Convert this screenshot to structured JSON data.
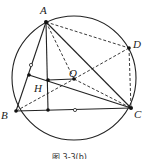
{
  "figure": {
    "caption": "图 3-3(b)",
    "circle": {
      "cx": 74,
      "cy": 78,
      "r": 62
    },
    "points": {
      "A": {
        "x": 46,
        "y": 22,
        "label": "A",
        "lx": 40,
        "ly": 14
      },
      "B": {
        "x": 16,
        "y": 111,
        "label": "B",
        "lx": 2,
        "ly": 118
      },
      "C": {
        "x": 131,
        "y": 108,
        "label": "C",
        "lx": 134,
        "ly": 117
      },
      "D": {
        "x": 129,
        "y": 48,
        "label": "D",
        "lx": 133,
        "ly": 46
      },
      "O": {
        "x": 74,
        "y": 79,
        "label": "O",
        "lx": 69,
        "ly": 75
      },
      "H": {
        "x": 48,
        "y": 80,
        "label": "H",
        "lx": 34,
        "ly": 91
      }
    },
    "labels": {
      "A": "A",
      "B": "B",
      "C": "C",
      "D": "D",
      "O": "O",
      "H": "H"
    }
  }
}
